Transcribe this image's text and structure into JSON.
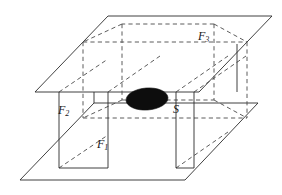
{
  "figure": {
    "background_color": "#ffffff",
    "line_color": "#2b2b2b",
    "dashed_color": "#4a4a4a",
    "blob_color": "#0d0d0d",
    "labels": [
      {
        "id": "F3",
        "base": "F",
        "sub": "3",
        "x": 198,
        "y": 41
      },
      {
        "id": "F2",
        "base": "F",
        "sub": "2",
        "x": 58,
        "y": 116
      },
      {
        "id": "F1",
        "base": "F",
        "sub": "1",
        "x": 97,
        "y": 150
      },
      {
        "id": "S",
        "base": "S",
        "sub": "",
        "x": 173,
        "y": 114
      }
    ],
    "shapes": {
      "top_plane": {
        "name": "top-plane-parallelogram",
        "points": "108,16 272,16 199,92 35,92"
      },
      "bottom_plane": {
        "name": "bottom-plane-parallelogram",
        "points": "94,103 258,103 185,180 20,180"
      },
      "blob": {
        "name": "region-s-ellipse",
        "cx": 147,
        "cy": 99,
        "rx": 21,
        "ry": 11,
        "rotation": -4
      },
      "solid_segments": [
        "M 59,92 L 59,168",
        "M 59,168 L 108,168",
        "M 108,168 L 108,92",
        "M 176,92 L 176,168",
        "M 176,168 L 194,168",
        "M 194,92 L 194,168",
        "M 237,44 L 237,92",
        "M 94,92 L 94,103"
      ],
      "dashed_segments": [
        "M 83,42 L 247,42",
        "M 83,42 L 83,118",
        "M 247,42 L 247,118",
        "M 83,118 L 247,118",
        "M 122,24 L 122,100",
        "M 122,24 L 83,42",
        "M 122,100 L 83,118",
        "M 214,24 L 122,24",
        "M 214,24 L 247,42",
        "M 214,100 L 247,118",
        "M 122,100 L 214,100",
        "M 214,24 L 214,100",
        "M 59,92 L 108,59",
        "M 59,168 L 108,135",
        "M 108,92 L 160,56",
        "M 176,92 L 228,56",
        "M 176,168 L 228,132",
        "M 194,92 L 246,56"
      ]
    }
  }
}
